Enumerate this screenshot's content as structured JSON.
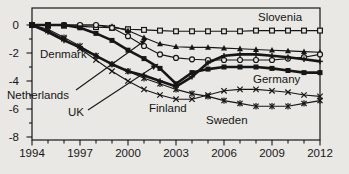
{
  "figure": {
    "background": "#e9e8e4",
    "ink": "#161616",
    "title": ""
  },
  "chart_data": {
    "type": "line",
    "title": "",
    "xlabel": "",
    "ylabel": "",
    "xlim": [
      1994,
      2012
    ],
    "ylim": [
      -8.2,
      1.2
    ],
    "grid": false,
    "legend": "inline-labels",
    "x": [
      1994,
      1995,
      1996,
      1997,
      1998,
      1999,
      2000,
      2001,
      2002,
      2003,
      2004,
      2005,
      2006,
      2007,
      2008,
      2009,
      2010,
      2011,
      2012
    ],
    "xticks": [
      1994,
      1997,
      2000,
      2003,
      2006,
      2009,
      2012
    ],
    "yticks": [
      0,
      -2,
      -4,
      -6,
      -8
    ],
    "series": [
      {
        "name": "Slovenia",
        "marker": "open-square",
        "line_weight": "thin",
        "values": [
          0,
          0,
          -0.05,
          -0.1,
          -0.15,
          -0.2,
          -0.3,
          -0.35,
          -0.4,
          -0.45,
          -0.45,
          -0.45,
          -0.45,
          -0.45,
          -0.4,
          -0.4,
          -0.4,
          -0.4,
          -0.4
        ]
      },
      {
        "name": "Netherlands",
        "marker": "triangle",
        "line_weight": "thin",
        "values": [
          0,
          0,
          0,
          0,
          0,
          -0.1,
          -0.4,
          -0.9,
          -1.35,
          -1.55,
          -1.6,
          -1.6,
          -1.65,
          -1.7,
          -1.75,
          -1.8,
          -1.85,
          -1.9,
          -1.95
        ]
      },
      {
        "name": "UK",
        "marker": "open-circle",
        "line_weight": "thin",
        "values": [
          0,
          0,
          0,
          0,
          0,
          -0.2,
          -0.8,
          -1.5,
          -2.1,
          -2.35,
          -2.45,
          -2.5,
          -2.5,
          -2.5,
          -2.5,
          -2.5,
          -2.4,
          -2.3,
          -2.1
        ]
      },
      {
        "name": "Finland",
        "marker": "x",
        "line_weight": "thin",
        "values": [
          0,
          -0.4,
          -1.0,
          -1.7,
          -2.5,
          -3.3,
          -4.0,
          -4.6,
          -5.0,
          -5.3,
          -5.3,
          -5.0,
          -4.7,
          -4.6,
          -4.6,
          -4.7,
          -4.8,
          -5.0,
          -5.1
        ]
      },
      {
        "name": "Sweden",
        "marker": "star",
        "line_weight": "thin",
        "values": [
          0,
          -0.3,
          -0.9,
          -1.5,
          -2.2,
          -2.8,
          -3.3,
          -3.8,
          -4.2,
          -4.6,
          -4.9,
          -5.1,
          -5.4,
          -5.6,
          -5.8,
          -5.8,
          -5.8,
          -5.6,
          -5.4
        ]
      },
      {
        "name": "Germany",
        "marker": "filled-square",
        "line_weight": "thick",
        "values": [
          0,
          0,
          0,
          -0.2,
          -0.6,
          -1.1,
          -1.8,
          -2.4,
          -3.1,
          -4.2,
          -3.4,
          -3.15,
          -3.0,
          -3.0,
          -3.0,
          -3.1,
          -3.25,
          -3.4,
          -3.4
        ]
      },
      {
        "name": "Denmark",
        "marker": "plus",
        "line_weight": "thick",
        "values": [
          0,
          -0.5,
          -1.1,
          -1.6,
          -2.2,
          -2.8,
          -3.3,
          -3.6,
          -4.0,
          -4.4,
          -3.7,
          -2.7,
          -2.2,
          -2.1,
          -2.1,
          -2.2,
          -2.3,
          -2.45,
          -2.6
        ]
      }
    ],
    "annotations": [
      {
        "id": "slovenia",
        "text": "Slovenia",
        "px": {
          "x": 258,
          "y": 21
        }
      },
      {
        "id": "denmark",
        "text": "Denmark",
        "px": {
          "x": 40,
          "y": 58
        }
      },
      {
        "id": "netherlands",
        "text": "Netherlands",
        "px": {
          "x": 7,
          "y": 99
        },
        "leader": {
          "x1": 76,
          "y1": 90,
          "x2": 147,
          "y2": 39
        }
      },
      {
        "id": "uk",
        "text": "UK",
        "px": {
          "x": 68,
          "y": 116
        },
        "leader": {
          "x1": 88,
          "y1": 110,
          "x2": 158,
          "y2": 64
        }
      },
      {
        "id": "finland",
        "text": "Finland",
        "px": {
          "x": 149,
          "y": 112
        }
      },
      {
        "id": "sweden",
        "text": "Sweden",
        "px": {
          "x": 206,
          "y": 124
        }
      },
      {
        "id": "germany",
        "text": "Germany",
        "px": {
          "x": 253,
          "y": 83
        }
      }
    ]
  }
}
